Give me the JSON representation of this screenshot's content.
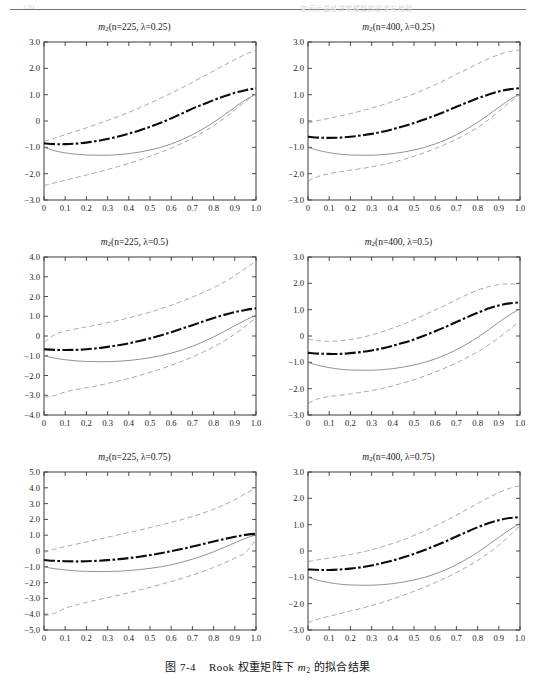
{
  "header": {
    "left_text": "· 130 ·",
    "right_text": "空间计量经济学模型的设定与检验"
  },
  "caption": {
    "figure_label": "图 7-4",
    "text_before": "Rook 权重矩阵下",
    "symbol": "m",
    "symbol_sub": "2",
    "text_after": "的拟合结果"
  },
  "figure": {
    "panels": [
      {
        "id": "panel-n225-lam025",
        "title_symbol": "m",
        "title_sub": "2",
        "title_args": "(n=225,  λ=0.25)",
        "ylim": [
          -3.0,
          3.0
        ],
        "ytick_labels": [
          "3.0",
          "2.0",
          "1.0",
          "0",
          "-1.0",
          "-2.0",
          "-3.0"
        ],
        "ytick_values": [
          3.0,
          2.0,
          1.0,
          0,
          -1.0,
          -2.0,
          -3.0
        ]
      },
      {
        "id": "panel-n400-lam025",
        "title_symbol": "m",
        "title_sub": "2",
        "title_args": "(n=400,  λ=0.25)",
        "ylim": [
          -3.0,
          3.0
        ],
        "ytick_labels": [
          "3.0",
          "2.0",
          "1.0",
          "0",
          "-1.0",
          "-2.0",
          "-3.0"
        ],
        "ytick_values": [
          3.0,
          2.0,
          1.0,
          0,
          -1.0,
          -2.0,
          -3.0
        ]
      },
      {
        "id": "panel-n225-lam05",
        "title_symbol": "m",
        "title_sub": "2",
        "title_args": "(n=225,  λ=0.5)",
        "ylim": [
          -4.0,
          4.0
        ],
        "ytick_labels": [
          "4.0",
          "3.0",
          "2.0",
          "1.0",
          "0",
          "-1.0",
          "-2.0",
          "-3.0",
          "-4.0"
        ],
        "ytick_values": [
          4.0,
          3.0,
          2.0,
          1.0,
          0,
          -1.0,
          -2.0,
          -3.0,
          -4.0
        ]
      },
      {
        "id": "panel-n400-lam05",
        "title_symbol": "m",
        "title_sub": "2",
        "title_args": "(n=400,  λ=0.5)",
        "ylim": [
          -3.0,
          3.0
        ],
        "ytick_labels": [
          "3.0",
          "2.0",
          "1.0",
          "0",
          "-1.0",
          "-2.0",
          "-3.0"
        ],
        "ytick_values": [
          3.0,
          2.0,
          1.0,
          0,
          -1.0,
          -2.0,
          -3.0
        ]
      },
      {
        "id": "panel-n225-lam075",
        "title_symbol": "m",
        "title_sub": "2",
        "title_args": "(n=225,  λ=0.75)",
        "ylim": [
          -5.0,
          5.0
        ],
        "ytick_labels": [
          "5.0",
          "4.0",
          "3.0",
          "2.0",
          "1.0",
          "0",
          "-1.0",
          "-2.0",
          "-3.0",
          "-4.0",
          "-5.0"
        ],
        "ytick_values": [
          5.0,
          4.0,
          3.0,
          2.0,
          1.0,
          0,
          -1.0,
          -2.0,
          -3.0,
          -4.0,
          -5.0
        ]
      },
      {
        "id": "panel-n400-lam075",
        "title_symbol": "m",
        "title_sub": "2",
        "title_args": "(n=400,  λ=0.75)",
        "ylim": [
          -3.0,
          3.0
        ],
        "ytick_labels": [
          "3.0",
          "2.0",
          "1.0",
          "0",
          "-1.0",
          "-2.0",
          "-3.0"
        ],
        "ytick_values": [
          3.0,
          2.0,
          1.0,
          0,
          -1.0,
          -2.0,
          -3.0
        ]
      }
    ]
  },
  "chart_data": {
    "type": "line",
    "title": "图 7-4 Rook 权重矩阵下 m2 的拟合结果",
    "layout": {
      "rows": 3,
      "cols": 2,
      "grid": false,
      "legend": "none"
    },
    "xlabel": "",
    "ylabel": "",
    "xlim": [
      0,
      1
    ],
    "x": [
      0,
      0.05,
      0.1,
      0.15,
      0.2,
      0.25,
      0.3,
      0.35,
      0.4,
      0.45,
      0.5,
      0.55,
      0.6,
      0.65,
      0.7,
      0.75,
      0.8,
      0.85,
      0.9,
      0.95,
      1.0
    ],
    "xtick_labels": [
      "0",
      "0.1",
      "0.2",
      "0.3",
      "0.4",
      "0.5",
      "0.6",
      "0.7",
      "0.8",
      "0.9",
      "1.0"
    ],
    "xtick_values": [
      0,
      0.1,
      0.2,
      0.3,
      0.4,
      0.5,
      0.6,
      0.7,
      0.8,
      0.9,
      1.0
    ],
    "series_styles": [
      {
        "name": "fitted mean",
        "style": "thick-dash-dot",
        "color": "#0b0b0b"
      },
      {
        "name": "true function",
        "style": "solid-thin",
        "color": "#7d7d7d"
      },
      {
        "name": "upper band",
        "style": "dashed-thin",
        "color": "#9a9a9a"
      },
      {
        "name": "lower band",
        "style": "dashed-thin",
        "color": "#9a9a9a"
      }
    ],
    "panels": [
      {
        "title": "m2(n=225, λ=0.25)",
        "ylim": [
          -3.0,
          3.0
        ],
        "series": [
          {
            "name": "fitted mean",
            "values": [
              -0.85,
              -0.88,
              -0.88,
              -0.86,
              -0.82,
              -0.76,
              -0.68,
              -0.59,
              -0.48,
              -0.36,
              -0.22,
              -0.07,
              0.1,
              0.28,
              0.47,
              0.63,
              0.79,
              0.94,
              1.07,
              1.17,
              1.24
            ]
          },
          {
            "name": "true function",
            "values": [
              -1.0,
              -1.13,
              -1.21,
              -1.26,
              -1.29,
              -1.3,
              -1.3,
              -1.28,
              -1.24,
              -1.18,
              -1.1,
              -1.0,
              -0.87,
              -0.71,
              -0.52,
              -0.3,
              -0.05,
              0.23,
              0.52,
              0.8,
              1.03
            ]
          },
          {
            "name": "upper band",
            "values": [
              -0.78,
              -0.65,
              -0.52,
              -0.39,
              -0.26,
              -0.12,
              0.02,
              0.17,
              0.33,
              0.5,
              0.68,
              0.87,
              1.06,
              1.26,
              1.47,
              1.68,
              1.9,
              2.12,
              2.33,
              2.53,
              2.7
            ]
          },
          {
            "name": "lower band",
            "values": [
              -2.45,
              -2.35,
              -2.25,
              -2.15,
              -2.05,
              -1.95,
              -1.84,
              -1.73,
              -1.61,
              -1.48,
              -1.34,
              -1.19,
              -1.03,
              -0.85,
              -0.65,
              -0.43,
              -0.18,
              0.1,
              0.42,
              0.74,
              1.03
            ]
          }
        ]
      },
      {
        "title": "m2(n=400, λ=0.25)",
        "ylim": [
          -3.0,
          3.0
        ],
        "series": [
          {
            "name": "fitted mean",
            "values": [
              -0.6,
              -0.63,
              -0.64,
              -0.63,
              -0.6,
              -0.55,
              -0.49,
              -0.41,
              -0.31,
              -0.2,
              -0.08,
              0.06,
              0.21,
              0.37,
              0.54,
              0.7,
              0.86,
              1.0,
              1.12,
              1.2,
              1.25
            ]
          },
          {
            "name": "true function",
            "values": [
              -1.0,
              -1.12,
              -1.2,
              -1.26,
              -1.29,
              -1.3,
              -1.3,
              -1.28,
              -1.24,
              -1.18,
              -1.1,
              -1.0,
              -0.87,
              -0.71,
              -0.52,
              -0.3,
              -0.05,
              0.23,
              0.52,
              0.8,
              1.03
            ]
          },
          {
            "name": "upper band",
            "values": [
              -0.08,
              0.02,
              0.1,
              0.19,
              0.28,
              0.38,
              0.49,
              0.61,
              0.74,
              0.88,
              1.03,
              1.2,
              1.38,
              1.57,
              1.77,
              1.97,
              2.17,
              2.36,
              2.52,
              2.64,
              2.7
            ]
          },
          {
            "name": "lower band",
            "values": [
              -2.28,
              -2.1,
              -2.0,
              -1.93,
              -1.87,
              -1.81,
              -1.74,
              -1.66,
              -1.57,
              -1.46,
              -1.34,
              -1.2,
              -1.05,
              -0.88,
              -0.69,
              -0.48,
              -0.25,
              0.04,
              0.36,
              0.7,
              1.0
            ]
          }
        ]
      },
      {
        "title": "m2(n=225, λ=0.5)",
        "ylim": [
          -4.0,
          4.0
        ],
        "series": [
          {
            "name": "fitted mean",
            "values": [
              -0.67,
              -0.7,
              -0.71,
              -0.7,
              -0.67,
              -0.62,
              -0.55,
              -0.47,
              -0.37,
              -0.25,
              -0.12,
              0.03,
              0.19,
              0.37,
              0.55,
              0.73,
              0.91,
              1.07,
              1.21,
              1.32,
              1.4
            ]
          },
          {
            "name": "true function",
            "values": [
              -1.0,
              -1.12,
              -1.2,
              -1.26,
              -1.29,
              -1.3,
              -1.3,
              -1.28,
              -1.24,
              -1.18,
              -1.1,
              -1.0,
              -0.87,
              -0.71,
              -0.52,
              -0.3,
              -0.05,
              0.23,
              0.52,
              0.8,
              1.05
            ]
          },
          {
            "name": "upper band",
            "values": [
              -0.33,
              0.07,
              0.24,
              0.36,
              0.46,
              0.56,
              0.67,
              0.79,
              0.92,
              1.06,
              1.21,
              1.38,
              1.56,
              1.76,
              1.97,
              2.2,
              2.45,
              2.73,
              3.05,
              3.42,
              3.78
            ]
          },
          {
            "name": "lower band",
            "values": [
              -3.1,
              -3.02,
              -2.83,
              -2.72,
              -2.62,
              -2.52,
              -2.4,
              -2.28,
              -2.15,
              -2.0,
              -1.84,
              -1.67,
              -1.48,
              -1.28,
              -1.06,
              -0.82,
              -0.55,
              -0.25,
              0.1,
              0.5,
              0.92
            ]
          }
        ]
      },
      {
        "title": "m2(n=400, λ=0.5)",
        "ylim": [
          -3.0,
          3.0
        ],
        "series": [
          {
            "name": "fitted mean",
            "values": [
              -0.64,
              -0.67,
              -0.68,
              -0.68,
              -0.65,
              -0.61,
              -0.55,
              -0.47,
              -0.37,
              -0.26,
              -0.13,
              0.02,
              0.18,
              0.35,
              0.53,
              0.71,
              0.88,
              1.04,
              1.16,
              1.24,
              1.28
            ]
          },
          {
            "name": "true function",
            "values": [
              -1.0,
              -1.12,
              -1.2,
              -1.26,
              -1.29,
              -1.3,
              -1.3,
              -1.28,
              -1.24,
              -1.18,
              -1.1,
              -1.0,
              -0.87,
              -0.71,
              -0.52,
              -0.3,
              -0.05,
              0.23,
              0.52,
              0.8,
              1.03
            ]
          },
          {
            "name": "upper band",
            "values": [
              -0.12,
              -0.18,
              -0.2,
              -0.18,
              -0.13,
              -0.06,
              0.04,
              0.16,
              0.3,
              0.45,
              0.62,
              0.8,
              0.99,
              1.18,
              1.38,
              1.57,
              1.74,
              1.87,
              1.95,
              1.98,
              1.96
            ]
          },
          {
            "name": "lower band",
            "values": [
              -2.55,
              -2.38,
              -2.3,
              -2.25,
              -2.2,
              -2.14,
              -2.07,
              -1.99,
              -1.89,
              -1.78,
              -1.66,
              -1.52,
              -1.37,
              -1.2,
              -1.02,
              -0.82,
              -0.6,
              -0.35,
              -0.07,
              0.25,
              0.58
            ]
          }
        ]
      },
      {
        "title": "m2(n=225, λ=0.75)",
        "ylim": [
          -5.0,
          5.0
        ],
        "series": [
          {
            "name": "fitted mean",
            "values": [
              -0.57,
              -0.62,
              -0.65,
              -0.66,
              -0.65,
              -0.62,
              -0.58,
              -0.52,
              -0.45,
              -0.36,
              -0.26,
              -0.14,
              -0.01,
              0.13,
              0.28,
              0.44,
              0.6,
              0.76,
              0.9,
              1.02,
              1.1
            ]
          },
          {
            "name": "true function",
            "values": [
              -1.0,
              -1.12,
              -1.2,
              -1.26,
              -1.29,
              -1.3,
              -1.3,
              -1.28,
              -1.24,
              -1.18,
              -1.1,
              -1.0,
              -0.87,
              -0.71,
              -0.52,
              -0.3,
              -0.05,
              0.23,
              0.52,
              0.8,
              1.02
            ]
          },
          {
            "name": "upper band",
            "values": [
              -0.1,
              0.12,
              0.28,
              0.43,
              0.57,
              0.72,
              0.87,
              1.02,
              1.17,
              1.32,
              1.48,
              1.64,
              1.81,
              1.99,
              2.18,
              2.4,
              2.64,
              2.92,
              3.24,
              3.62,
              3.98
            ]
          },
          {
            "name": "lower band",
            "values": [
              -4.1,
              -3.95,
              -3.62,
              -3.42,
              -3.25,
              -3.1,
              -2.95,
              -2.8,
              -2.64,
              -2.47,
              -2.3,
              -2.12,
              -1.93,
              -1.73,
              -1.52,
              -1.29,
              -1.04,
              -0.76,
              -0.45,
              -0.1,
              0.72
            ]
          }
        ]
      },
      {
        "title": "m2(n=400, λ=0.75)",
        "ylim": [
          -3.0,
          3.0
        ],
        "series": [
          {
            "name": "fitted mean",
            "values": [
              -0.7,
              -0.72,
              -0.72,
              -0.7,
              -0.67,
              -0.62,
              -0.55,
              -0.46,
              -0.36,
              -0.24,
              -0.11,
              0.04,
              0.2,
              0.37,
              0.55,
              0.73,
              0.9,
              1.05,
              1.17,
              1.25,
              1.29
            ]
          },
          {
            "name": "true function",
            "values": [
              -1.0,
              -1.12,
              -1.2,
              -1.26,
              -1.29,
              -1.3,
              -1.3,
              -1.28,
              -1.24,
              -1.18,
              -1.1,
              -1.0,
              -0.87,
              -0.71,
              -0.52,
              -0.3,
              -0.05,
              0.23,
              0.52,
              0.8,
              1.05
            ]
          },
          {
            "name": "upper band",
            "values": [
              -0.4,
              -0.33,
              -0.27,
              -0.2,
              -0.13,
              -0.05,
              0.05,
              0.16,
              0.29,
              0.43,
              0.59,
              0.76,
              0.95,
              1.15,
              1.36,
              1.58,
              1.8,
              2.02,
              2.22,
              2.38,
              2.48
            ]
          },
          {
            "name": "lower band",
            "values": [
              -2.72,
              -2.58,
              -2.48,
              -2.38,
              -2.28,
              -2.18,
              -2.07,
              -1.95,
              -1.82,
              -1.68,
              -1.53,
              -1.37,
              -1.2,
              -1.02,
              -0.82,
              -0.6,
              -0.36,
              -0.09,
              0.22,
              0.58,
              0.95
            ]
          }
        ]
      }
    ]
  }
}
